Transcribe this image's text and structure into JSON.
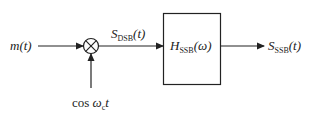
{
  "diagram": {
    "input": {
      "name": "m",
      "arg": "(t)"
    },
    "multiplier": {
      "symbol": "⊗"
    },
    "carrier": {
      "func": "cos ",
      "omega": "ω",
      "sub": "c",
      "var": "t"
    },
    "dsb_signal": {
      "name": "S",
      "sub": "DSB",
      "arg": "(t)"
    },
    "filter": {
      "name": "H",
      "sub": "SSB",
      "arg": "(ω)"
    },
    "output": {
      "name": "S",
      "sub": "SSB",
      "arg": "(t)"
    }
  }
}
